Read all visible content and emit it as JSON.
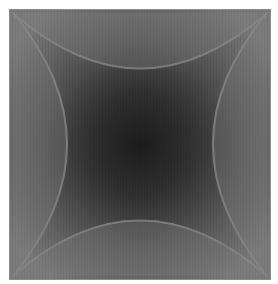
{
  "figure": {
    "description": "Gray square with dark radial center and four concave arcs",
    "colors": {
      "background": "#ffffff",
      "square_edge": "#7a7a7a",
      "square_mid": "#5a5a5a",
      "center_dark": "#1e1e1e",
      "arc_line": "#8a8a8a"
    }
  }
}
